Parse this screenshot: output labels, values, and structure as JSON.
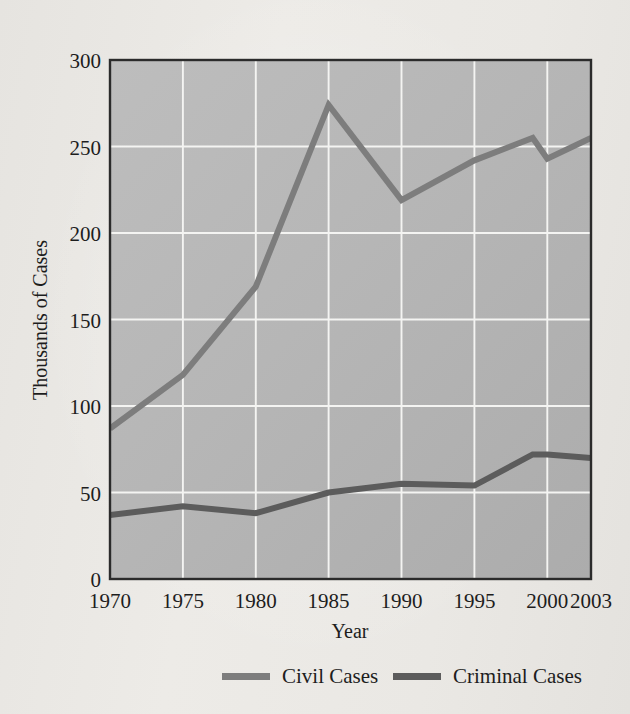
{
  "figure": {
    "background_color": "#eceae6",
    "plot_background_color": "#b6b6b6",
    "border_color": "#2b2b2b",
    "gridline_color": "#f4f4f2"
  },
  "axes": {
    "x": {
      "title": "Year",
      "tick_labels": [
        "1970",
        "1975",
        "1980",
        "1985",
        "1990",
        "1995",
        "2000",
        "2003"
      ],
      "min": 1970,
      "max": 2003
    },
    "y": {
      "title": "Thousands of Cases",
      "tick_labels": [
        "0",
        "50",
        "100",
        "150",
        "200",
        "250",
        "300"
      ],
      "min": 0,
      "max": 300
    }
  },
  "legend": {
    "position": "bottom",
    "entries": [
      {
        "label": "Civil Cases",
        "color": "#7d7d7d"
      },
      {
        "label": "Criminal Cases",
        "color": "#5c5c5c"
      }
    ]
  },
  "chart_data": {
    "type": "line",
    "title": "",
    "subtitle": "",
    "xlabel": "Year",
    "ylabel": "Thousands of Cases",
    "xlim": [
      1970,
      2003
    ],
    "ylim": [
      0,
      300
    ],
    "xticks": [
      1970,
      1975,
      1980,
      1985,
      1990,
      1995,
      2000,
      2003
    ],
    "yticks": [
      0,
      50,
      100,
      150,
      200,
      250,
      300
    ],
    "grid": true,
    "legend_position": "bottom",
    "x": [
      1970,
      1975,
      1980,
      1985,
      1990,
      1995,
      1999,
      2000,
      2003
    ],
    "series": [
      {
        "name": "Civil Cases",
        "color": "#7d7d7d",
        "line_width": 6,
        "values": [
          87,
          118,
          169,
          274,
          219,
          242,
          255,
          243,
          255
        ]
      },
      {
        "name": "Criminal Cases",
        "color": "#5c5c5c",
        "line_width": 6,
        "values": [
          37,
          42,
          38,
          50,
          55,
          54,
          72,
          72,
          70
        ]
      }
    ]
  }
}
